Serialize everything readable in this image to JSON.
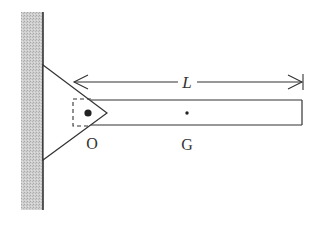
{
  "figure": {
    "labels": {
      "length": "L",
      "pivot": "O",
      "center_of_mass": "G"
    },
    "colors": {
      "stroke": "#333333",
      "wall_fill": "#c8c8c8",
      "background": "#ffffff"
    }
  }
}
